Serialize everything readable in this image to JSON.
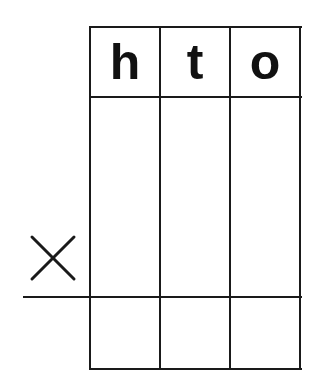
{
  "diagram": {
    "type": "place-value multiplication grid",
    "columns": [
      {
        "label": "h"
      },
      {
        "label": "t"
      },
      {
        "label": "o"
      }
    ],
    "operator": {
      "symbol": "×",
      "icon": "multiplication-sign-icon"
    },
    "rows": [
      {
        "name": "multiplicand",
        "cells": [
          "",
          "",
          ""
        ]
      },
      {
        "name": "result",
        "cells": [
          "",
          "",
          ""
        ]
      }
    ],
    "colors": {
      "line": "#1a1a1a",
      "text": "#111111",
      "background": "#ffffff"
    }
  }
}
